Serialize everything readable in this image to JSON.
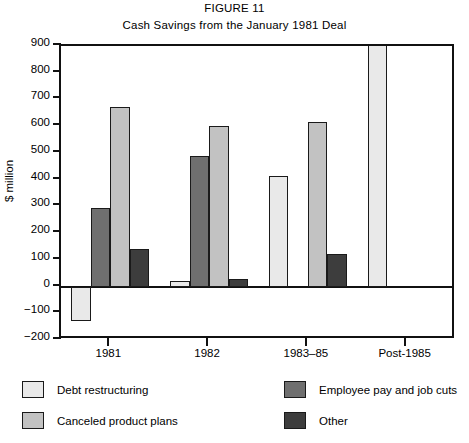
{
  "figure": {
    "number": "FIGURE 11",
    "subtitle": "Cash Savings from the January 1981 Deal"
  },
  "chart_data": {
    "type": "bar",
    "title": "Cash Savings from the January 1981 Deal",
    "xlabel": "",
    "ylabel": "$ million",
    "ylim": [
      -200,
      900
    ],
    "ytick_step": 100,
    "yticks": [
      900,
      800,
      700,
      600,
      500,
      400,
      300,
      200,
      100,
      0,
      -100,
      -200
    ],
    "ytick_labels": [
      "900",
      "800",
      "700",
      "600",
      "500",
      "400",
      "300",
      "200",
      "100",
      "0",
      "−100",
      "−200"
    ],
    "grid": false,
    "legend_position": "below",
    "categories": [
      "1981",
      "1982",
      "1983–85",
      "Post-1985"
    ],
    "series": [
      {
        "name": "Debt restructuring",
        "color": "#e9e9e9",
        "values": [
          -130,
          20,
          415,
          900
        ],
        "clipped": [
          false,
          false,
          false,
          true
        ]
      },
      {
        "name": "Employee pay and job cuts",
        "color": "#6f6f6f",
        "values": [
          295,
          490,
          null,
          null
        ]
      },
      {
        "name": "Canceled product plans",
        "color": "#c2c2c2",
        "values": [
          670,
          600,
          615,
          null
        ]
      },
      {
        "name": "Other",
        "color": "#3d3d3d",
        "values": [
          140,
          30,
          120,
          null
        ]
      }
    ]
  },
  "legend": {
    "items": [
      {
        "label": "Debt restructuring",
        "color": "#e9e9e9"
      },
      {
        "label": "Canceled product plans",
        "color": "#c2c2c2"
      },
      {
        "label": "Employee pay and job cuts",
        "color": "#6f6f6f"
      },
      {
        "label": "Other",
        "color": "#3d3d3d"
      }
    ]
  }
}
